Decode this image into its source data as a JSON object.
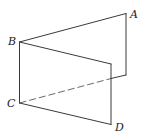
{
  "diagram": {
    "type": "dihedral-angle / two half-planes sharing edge BC",
    "labels": {
      "A": "A",
      "B": "B",
      "C": "C",
      "D": "D"
    },
    "points": {
      "B": [
        19.5,
        42
      ],
      "C": [
        19.5,
        103
      ],
      "A_top": [
        126,
        13.5
      ],
      "A_bottom": [
        126,
        75
      ],
      "front_top_right": [
        111,
        64
      ],
      "D_corner": [
        111,
        124.5
      ],
      "occlusion_point": [
        111,
        78.5
      ]
    },
    "colors": {
      "line": "#3a3a3a",
      "hidden_line": "#6a6a6a",
      "background": "#ffffff"
    }
  }
}
